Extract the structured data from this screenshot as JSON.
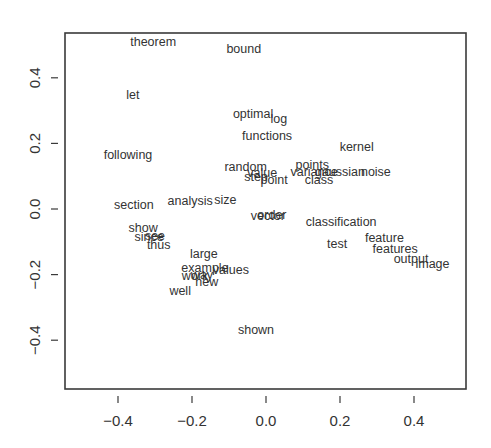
{
  "chart_data": {
    "type": "scatter",
    "title": "",
    "xlabel": "",
    "ylabel": "",
    "xlim": [
      -0.54,
      0.54
    ],
    "ylim": [
      -0.55,
      0.54
    ],
    "grid": false,
    "legend": null,
    "marker": "text",
    "xticks": [
      -0.4,
      -0.2,
      0.0,
      0.2,
      0.4
    ],
    "yticks": [
      -0.4,
      -0.2,
      0.0,
      0.2,
      0.4
    ],
    "xtick_labels": [
      "−0.4",
      "−0.2",
      "0.0",
      "0.2",
      "0.4"
    ],
    "ytick_labels": [
      "−0.4",
      "−0.2",
      "0.0",
      "0.2",
      "0.4"
    ],
    "points": [
      {
        "label": "theorem",
        "x": -0.305,
        "y": 0.51
      },
      {
        "label": "bound",
        "x": -0.06,
        "y": 0.49
      },
      {
        "label": "let",
        "x": -0.36,
        "y": 0.35
      },
      {
        "label": "optimal",
        "x": -0.035,
        "y": 0.29
      },
      {
        "label": "log",
        "x": 0.035,
        "y": 0.275
      },
      {
        "label": "functions",
        "x": 0.003,
        "y": 0.225
      },
      {
        "label": "kernel",
        "x": 0.245,
        "y": 0.19
      },
      {
        "label": "following",
        "x": -0.373,
        "y": 0.165
      },
      {
        "label": "random",
        "x": -0.055,
        "y": 0.13
      },
      {
        "label": "value",
        "x": -0.01,
        "y": 0.11
      },
      {
        "label": "step",
        "x": -0.027,
        "y": 0.1
      },
      {
        "label": "point",
        "x": 0.022,
        "y": 0.09
      },
      {
        "label": "points",
        "x": 0.125,
        "y": 0.135
      },
      {
        "label": "variance",
        "x": 0.13,
        "y": 0.115
      },
      {
        "label": "gaussian",
        "x": 0.2,
        "y": 0.115
      },
      {
        "label": "noise",
        "x": 0.297,
        "y": 0.115
      },
      {
        "label": "class",
        "x": 0.143,
        "y": 0.09
      },
      {
        "label": "section",
        "x": -0.357,
        "y": 0.015
      },
      {
        "label": "analysis",
        "x": -0.205,
        "y": 0.025
      },
      {
        "label": "size",
        "x": -0.11,
        "y": 0.03
      },
      {
        "label": "vector",
        "x": 0.005,
        "y": -0.02
      },
      {
        "label": "order",
        "x": 0.016,
        "y": -0.018
      },
      {
        "label": "classification",
        "x": 0.203,
        "y": -0.037
      },
      {
        "label": "show",
        "x": -0.332,
        "y": -0.055
      },
      {
        "label": "since",
        "x": -0.316,
        "y": -0.085
      },
      {
        "label": "see",
        "x": -0.3,
        "y": -0.082
      },
      {
        "label": "thus",
        "x": -0.29,
        "y": -0.107
      },
      {
        "label": "test",
        "x": 0.192,
        "y": -0.104
      },
      {
        "label": "feature",
        "x": 0.32,
        "y": -0.088
      },
      {
        "label": "features",
        "x": 0.349,
        "y": -0.119
      },
      {
        "label": "output",
        "x": 0.392,
        "y": -0.152
      },
      {
        "label": "image",
        "x": 0.45,
        "y": -0.165
      },
      {
        "label": "large",
        "x": -0.168,
        "y": -0.137
      },
      {
        "label": "example",
        "x": -0.165,
        "y": -0.177
      },
      {
        "label": "values",
        "x": -0.095,
        "y": -0.183
      },
      {
        "label": "work",
        "x": -0.192,
        "y": -0.204
      },
      {
        "label": "way",
        "x": -0.173,
        "y": -0.201
      },
      {
        "label": "new",
        "x": -0.16,
        "y": -0.222
      },
      {
        "label": "well",
        "x": -0.232,
        "y": -0.247
      },
      {
        "label": "shown",
        "x": -0.027,
        "y": -0.366
      }
    ]
  },
  "layout": {
    "plot_left": 65,
    "plot_top": 33,
    "plot_right": 466,
    "plot_bottom": 389,
    "x_zero_px": 266,
    "x_px_per_unit": 370,
    "y_zero_px": 209,
    "y_px_per_unit": 328
  },
  "colors": {
    "text": "#333333",
    "axis": "#3a3a3a",
    "background": "#ffffff"
  }
}
